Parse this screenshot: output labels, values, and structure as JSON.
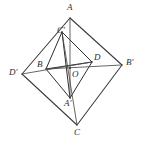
{
  "figure": {
    "width": 150,
    "height": 143,
    "background_color": "#ffffff",
    "stroke_color": "#3a3a3a",
    "label_color": "#2b2b2b",
    "points": [
      {
        "id": "A",
        "label": "A",
        "x": 70,
        "y": 18,
        "label_x": 67,
        "label_y": 3,
        "role": "outer-vertex-top"
      },
      {
        "id": "Bp",
        "label": "B'",
        "x": 122,
        "y": 65,
        "label_x": 126,
        "label_y": 58,
        "role": "outer-vertex-right"
      },
      {
        "id": "C",
        "label": "C",
        "x": 77,
        "y": 125,
        "label_x": 74,
        "label_y": 128,
        "role": "outer-vertex-bottom"
      },
      {
        "id": "Dp",
        "label": "D'",
        "x": 22,
        "y": 74,
        "label_x": 9,
        "label_y": 68,
        "role": "outer-vertex-left"
      },
      {
        "id": "Cp",
        "label": "C'",
        "x": 62,
        "y": 32,
        "label_x": 57,
        "label_y": 26,
        "role": "inner-vertex-top"
      },
      {
        "id": "D",
        "label": "D",
        "x": 92,
        "y": 62,
        "label_x": 94,
        "label_y": 53,
        "role": "inner-vertex-right"
      },
      {
        "id": "Ap",
        "label": "A'",
        "x": 70,
        "y": 98,
        "label_x": 64,
        "label_y": 99,
        "role": "inner-vertex-bottom"
      },
      {
        "id": "B",
        "label": "B",
        "x": 46,
        "y": 69,
        "label_x": 37,
        "label_y": 60,
        "role": "inner-vertex-left"
      },
      {
        "id": "O",
        "label": "O",
        "x": 70,
        "y": 68,
        "label_x": 72,
        "label_y": 70,
        "role": "center"
      }
    ],
    "edges": [
      {
        "name": "outer-edge-A-Bp",
        "from": "A",
        "to": "Bp",
        "kind": "outer"
      },
      {
        "name": "outer-edge-Bp-C",
        "from": "Bp",
        "to": "C",
        "kind": "outer"
      },
      {
        "name": "outer-edge-C-Dp",
        "from": "C",
        "to": "Dp",
        "kind": "outer"
      },
      {
        "name": "outer-edge-Dp-A",
        "from": "Dp",
        "to": "A",
        "kind": "outer"
      },
      {
        "name": "inner-edge-Cp-D",
        "from": "Cp",
        "to": "D",
        "kind": "inner"
      },
      {
        "name": "inner-edge-D-Ap",
        "from": "D",
        "to": "Ap",
        "kind": "inner"
      },
      {
        "name": "inner-edge-Ap-B",
        "from": "Ap",
        "to": "B",
        "kind": "inner"
      },
      {
        "name": "inner-edge-B-Cp",
        "from": "B",
        "to": "Cp",
        "kind": "inner"
      },
      {
        "name": "diagonal-B-D",
        "from": "B",
        "to": "D",
        "kind": "inner"
      },
      {
        "name": "diagonal-Cp-Ap",
        "from": "Cp",
        "to": "Ap",
        "kind": "inner"
      },
      {
        "name": "segment-A-Ap",
        "from": "A",
        "to": "Ap",
        "kind": "thin"
      },
      {
        "name": "segment-Cp-C",
        "from": "Cp",
        "to": "C",
        "kind": "thin"
      },
      {
        "name": "segment-B-Bp",
        "from": "B",
        "to": "Bp",
        "kind": "thin"
      },
      {
        "name": "segment-D-Dp",
        "from": "D",
        "to": "Dp",
        "kind": "thin"
      }
    ]
  }
}
